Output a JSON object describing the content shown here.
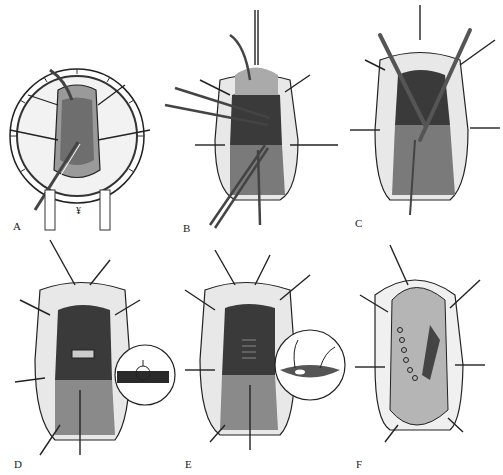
{
  "figure": {
    "panels": [
      {
        "id": "A",
        "label": "A",
        "description": "Ring retractor placed, initial exposure with instruments"
      },
      {
        "id": "B",
        "label": "B",
        "description": "Forceps and instruments grasping tissue, retraction sutures"
      },
      {
        "id": "C",
        "label": "C",
        "description": "Crossed instruments dissecting within exposed field"
      },
      {
        "id": "D",
        "label": "D",
        "description": "Suture repair begun with circular inset showing knot detail"
      },
      {
        "id": "E",
        "label": "E",
        "description": "Continued suture closure with circular inset showing tissue approximation"
      },
      {
        "id": "F",
        "label": "F",
        "description": "Completed closure with flap and row of sutures"
      }
    ],
    "insets": [
      {
        "panel": "D",
        "shape": "circle"
      },
      {
        "panel": "E",
        "shape": "circle"
      }
    ],
    "colors": {
      "background": "#ffffff",
      "ink": "#1a1a1a",
      "dark_tissue": "#3a3a3a",
      "mid_tissue": "#8a8a8a",
      "light_tissue": "#d8d8d8"
    }
  }
}
